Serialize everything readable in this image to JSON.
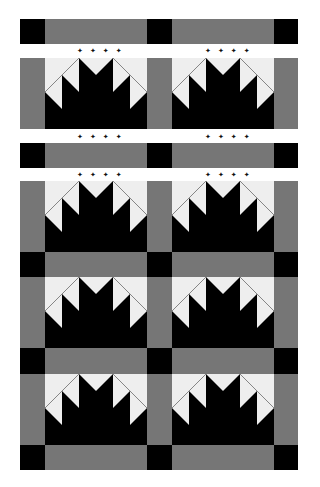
{
  "diagram": {
    "title": "",
    "type": "quilt layout diagram",
    "block_name": "maple leaf style (pine-tree / sawtooth crown) block",
    "colors": {
      "black": "#000000",
      "gray": "#767676",
      "light": "#eeeeee",
      "seam": "#8a8a8a",
      "background": "#ffffff"
    },
    "columns": 2,
    "block_rows": 4,
    "separated_top_section": true,
    "dot_marker": "✦ ✦ ✦ ✦",
    "dot_rows_y": [
      51,
      137,
      175
    ],
    "layout": {
      "x_edges": [
        20,
        45,
        147,
        172,
        274,
        298
      ],
      "rows": [
        {
          "kind": "sashing",
          "top": 19,
          "height": 25
        },
        {
          "kind": "blocks",
          "top": 58,
          "height": 71
        },
        {
          "kind": "sashing",
          "top": 143,
          "height": 25
        },
        {
          "kind": "blocks",
          "top": 181,
          "height": 71
        },
        {
          "kind": "sashing",
          "top": 252,
          "height": 25
        },
        {
          "kind": "blocks",
          "top": 277,
          "height": 71
        },
        {
          "kind": "sashing",
          "top": 348,
          "height": 26
        },
        {
          "kind": "blocks",
          "top": 374,
          "height": 71
        },
        {
          "kind": "sashing",
          "top": 445,
          "height": 25
        }
      ]
    }
  }
}
